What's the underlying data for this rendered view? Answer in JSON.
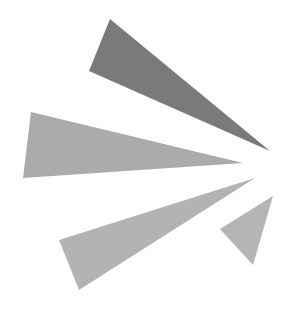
{
  "graphic": {
    "width": 289,
    "height": 316,
    "background": "#ffffff",
    "shapes": [
      {
        "name": "top-ray",
        "points": "110,19 89,71 270,151",
        "fill": "#7a7a7a"
      },
      {
        "name": "middle-ray",
        "points": "31,112 23,178 243,163",
        "fill": "#ababab"
      },
      {
        "name": "lower-ray",
        "points": "59,240 79,290 255,178",
        "fill": "#b3b3b3"
      },
      {
        "name": "small-ray",
        "points": "273,196 220,229 253,265",
        "fill": "#b5b5b5"
      }
    ]
  }
}
